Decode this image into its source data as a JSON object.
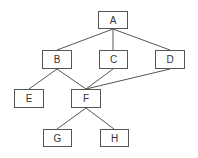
{
  "diagram": {
    "type": "hierarchy",
    "nodes": [
      {
        "id": "A",
        "label": "A",
        "x": 98,
        "y": 11,
        "w": 30,
        "h": 18
      },
      {
        "id": "B",
        "label": "B",
        "x": 42,
        "y": 50,
        "w": 30,
        "h": 19
      },
      {
        "id": "C",
        "label": "C",
        "x": 99,
        "y": 50,
        "w": 29,
        "h": 19
      },
      {
        "id": "D",
        "label": "D",
        "x": 155,
        "y": 50,
        "w": 30,
        "h": 19
      },
      {
        "id": "E",
        "label": "E",
        "x": 14,
        "y": 89,
        "w": 30,
        "h": 19
      },
      {
        "id": "F",
        "label": "F",
        "x": 71,
        "y": 89,
        "w": 30,
        "h": 19
      },
      {
        "id": "G",
        "label": "G",
        "x": 43,
        "y": 129,
        "w": 29,
        "h": 18
      },
      {
        "id": "H",
        "label": "H",
        "x": 100,
        "y": 129,
        "w": 29,
        "h": 18
      }
    ],
    "edges": [
      {
        "from": "A",
        "to": "B"
      },
      {
        "from": "A",
        "to": "C"
      },
      {
        "from": "A",
        "to": "D"
      },
      {
        "from": "B",
        "to": "E"
      },
      {
        "from": "B",
        "to": "F"
      },
      {
        "from": "C",
        "to": "F"
      },
      {
        "from": "D",
        "to": "F"
      },
      {
        "from": "F",
        "to": "G"
      },
      {
        "from": "F",
        "to": "H"
      }
    ]
  }
}
